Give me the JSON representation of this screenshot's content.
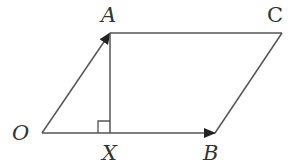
{
  "diagram": {
    "type": "parallelogram-vectors",
    "line_color": "#555555",
    "label_color": "#333333",
    "points": {
      "O": {
        "label": "O",
        "x": 42,
        "y": 133
      },
      "A": {
        "label": "A",
        "x": 110,
        "y": 33
      },
      "B": {
        "label": "B",
        "x": 215,
        "y": 133
      },
      "C": {
        "label": "C",
        "x": 282,
        "y": 33
      },
      "X": {
        "label": "X",
        "x": 110,
        "y": 133
      }
    },
    "edges": [
      {
        "from": "O",
        "to": "A",
        "arrow": true
      },
      {
        "from": "O",
        "to": "B",
        "arrow": true
      },
      {
        "from": "A",
        "to": "C",
        "arrow": false
      },
      {
        "from": "B",
        "to": "C",
        "arrow": false
      },
      {
        "from": "A",
        "to": "X",
        "arrow": false
      }
    ],
    "right_angle_at": "X"
  }
}
